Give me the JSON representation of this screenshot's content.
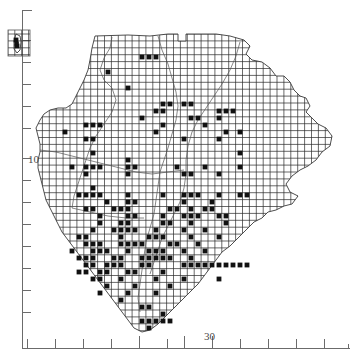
{
  "figure": {
    "kind": "distribution-atlas-map",
    "background_color": "#ffffff",
    "ink_color": "#1a1a1a",
    "grid_color": "#2a2a2a",
    "axis_color": "#6b6b6b"
  },
  "axes": {
    "x": {
      "label_values": [
        "30"
      ],
      "labeled_tick_x": 212,
      "tick_positions": [
        27,
        55,
        83,
        111,
        139,
        167,
        184,
        212,
        240,
        268,
        296,
        324,
        348
      ],
      "baseline_y": 348,
      "start_x": 22,
      "end_x": 350
    },
    "y": {
      "label_values": [
        "10"
      ],
      "labeled_tick_y": 158,
      "tick_positions": [
        18,
        40,
        62,
        84,
        106,
        128,
        158,
        180,
        202,
        224,
        246,
        268,
        290,
        312,
        334
      ],
      "baseline_x": 22,
      "start_y": 10,
      "end_y": 348
    }
  },
  "labels": {
    "y_axis_10": "10",
    "x_axis_30": "30"
  },
  "chart_data": {
    "type": "scatter",
    "title": "",
    "xlabel": "",
    "ylabel": "",
    "grid": true,
    "legend": null,
    "xlim": [
      0,
      352
    ],
    "ylim": [
      360,
      0
    ],
    "grid_cell_px": 6.9,
    "grid_origin": [
      35.5,
      34.0
    ],
    "records": [
      [
        16,
        40
      ],
      [
        17,
        46
      ],
      [
        142,
        57
      ],
      [
        149,
        57
      ],
      [
        156,
        57
      ],
      [
        108,
        72
      ],
      [
        128,
        88
      ],
      [
        163,
        104
      ],
      [
        170,
        104
      ],
      [
        184,
        104
      ],
      [
        191,
        104
      ],
      [
        156,
        111
      ],
      [
        163,
        111
      ],
      [
        219,
        111
      ],
      [
        226,
        111
      ],
      [
        233,
        111
      ],
      [
        142,
        118
      ],
      [
        191,
        118
      ],
      [
        198,
        118
      ],
      [
        219,
        118
      ],
      [
        86,
        125
      ],
      [
        93,
        125
      ],
      [
        100,
        125
      ],
      [
        163,
        125
      ],
      [
        205,
        125
      ],
      [
        65,
        132
      ],
      [
        156,
        132
      ],
      [
        226,
        132
      ],
      [
        240,
        132
      ],
      [
        86,
        139
      ],
      [
        93,
        139
      ],
      [
        184,
        139
      ],
      [
        219,
        139
      ],
      [
        93,
        153
      ],
      [
        240,
        153
      ],
      [
        128,
        160
      ],
      [
        72,
        167
      ],
      [
        86,
        167
      ],
      [
        93,
        167
      ],
      [
        100,
        167
      ],
      [
        128,
        167
      ],
      [
        135,
        167
      ],
      [
        177,
        167
      ],
      [
        205,
        167
      ],
      [
        240,
        167
      ],
      [
        86,
        174
      ],
      [
        128,
        174
      ],
      [
        184,
        174
      ],
      [
        191,
        174
      ],
      [
        219,
        174
      ],
      [
        93,
        188
      ],
      [
        79,
        195
      ],
      [
        86,
        195
      ],
      [
        93,
        195
      ],
      [
        100,
        195
      ],
      [
        128,
        195
      ],
      [
        163,
        195
      ],
      [
        184,
        195
      ],
      [
        191,
        195
      ],
      [
        198,
        195
      ],
      [
        219,
        195
      ],
      [
        240,
        195
      ],
      [
        247,
        195
      ],
      [
        107,
        202
      ],
      [
        128,
        202
      ],
      [
        135,
        202
      ],
      [
        184,
        202
      ],
      [
        212,
        202
      ],
      [
        86,
        209
      ],
      [
        93,
        209
      ],
      [
        114,
        209
      ],
      [
        121,
        209
      ],
      [
        128,
        209
      ],
      [
        170,
        209
      ],
      [
        177,
        209
      ],
      [
        191,
        209
      ],
      [
        205,
        209
      ],
      [
        212,
        209
      ],
      [
        100,
        216
      ],
      [
        128,
        216
      ],
      [
        135,
        216
      ],
      [
        163,
        216
      ],
      [
        184,
        216
      ],
      [
        191,
        216
      ],
      [
        198,
        216
      ],
      [
        219,
        216
      ],
      [
        226,
        216
      ],
      [
        100,
        223
      ],
      [
        121,
        223
      ],
      [
        128,
        223
      ],
      [
        163,
        223
      ],
      [
        170,
        223
      ],
      [
        191,
        223
      ],
      [
        226,
        223
      ],
      [
        93,
        230
      ],
      [
        114,
        230
      ],
      [
        121,
        230
      ],
      [
        128,
        230
      ],
      [
        135,
        230
      ],
      [
        156,
        230
      ],
      [
        184,
        230
      ],
      [
        205,
        230
      ],
      [
        79,
        237
      ],
      [
        86,
        237
      ],
      [
        121,
        237
      ],
      [
        149,
        237
      ],
      [
        156,
        237
      ],
      [
        163,
        237
      ],
      [
        191,
        237
      ],
      [
        219,
        237
      ],
      [
        86,
        244
      ],
      [
        93,
        244
      ],
      [
        100,
        244
      ],
      [
        121,
        244
      ],
      [
        128,
        244
      ],
      [
        135,
        244
      ],
      [
        142,
        244
      ],
      [
        170,
        244
      ],
      [
        177,
        244
      ],
      [
        198,
        244
      ],
      [
        72,
        251
      ],
      [
        93,
        251
      ],
      [
        100,
        251
      ],
      [
        107,
        251
      ],
      [
        128,
        251
      ],
      [
        149,
        251
      ],
      [
        156,
        251
      ],
      [
        163,
        251
      ],
      [
        184,
        251
      ],
      [
        205,
        251
      ],
      [
        79,
        258
      ],
      [
        86,
        258
      ],
      [
        93,
        258
      ],
      [
        114,
        258
      ],
      [
        121,
        258
      ],
      [
        142,
        258
      ],
      [
        149,
        258
      ],
      [
        156,
        258
      ],
      [
        163,
        258
      ],
      [
        170,
        258
      ],
      [
        191,
        258
      ],
      [
        86,
        265
      ],
      [
        93,
        265
      ],
      [
        107,
        265
      ],
      [
        114,
        265
      ],
      [
        121,
        265
      ],
      [
        142,
        265
      ],
      [
        149,
        265
      ],
      [
        184,
        265
      ],
      [
        191,
        265
      ],
      [
        198,
        265
      ],
      [
        205,
        265
      ],
      [
        212,
        265
      ],
      [
        219,
        265
      ],
      [
        226,
        265
      ],
      [
        233,
        265
      ],
      [
        240,
        265
      ],
      [
        247,
        265
      ],
      [
        79,
        272
      ],
      [
        86,
        272
      ],
      [
        100,
        272
      ],
      [
        107,
        272
      ],
      [
        128,
        272
      ],
      [
        135,
        272
      ],
      [
        163,
        272
      ],
      [
        93,
        279
      ],
      [
        100,
        279
      ],
      [
        121,
        279
      ],
      [
        156,
        279
      ],
      [
        184,
        279
      ],
      [
        219,
        279
      ],
      [
        107,
        286
      ],
      [
        135,
        286
      ],
      [
        170,
        286
      ],
      [
        100,
        293
      ],
      [
        128,
        293
      ],
      [
        156,
        293
      ],
      [
        121,
        300
      ],
      [
        142,
        307
      ],
      [
        149,
        307
      ],
      [
        163,
        314
      ],
      [
        142,
        321
      ],
      [
        149,
        321
      ],
      [
        156,
        321
      ],
      [
        163,
        321
      ],
      [
        170,
        321
      ],
      [
        149,
        328
      ]
    ]
  },
  "inset": {
    "present": true,
    "name": "offshore-island-inset",
    "x": 8,
    "y": 30,
    "width": 22,
    "height": 26
  }
}
